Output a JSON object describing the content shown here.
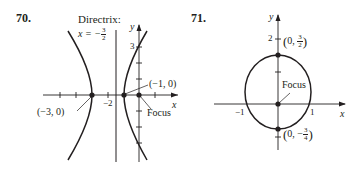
{
  "problems": [
    {
      "number": "70.",
      "type": "parabola",
      "directrix_label": "Directrix:",
      "directrix_eq": {
        "lhs": "x = −",
        "num": "3",
        "den": "2"
      },
      "axis_labels": {
        "x": "x",
        "y": "y"
      },
      "tick_labels": {
        "x_neg2": "−2",
        "y_3": "3"
      },
      "points": [
        {
          "label": "(−3, 0)",
          "x": -3,
          "y": 0
        },
        {
          "label": "(−1, 0)",
          "x": -1,
          "y": 0
        }
      ],
      "focus_label": "Focus",
      "focus": {
        "x": 0,
        "y": 0
      },
      "directrix_x": -1.5
    },
    {
      "number": "71.",
      "type": "ellipse",
      "axis_labels": {
        "x": "x",
        "y": "y"
      },
      "tick_labels": {
        "x_neg1": "−1",
        "x_1": "1",
        "y_2": "2"
      },
      "points": [
        {
          "label_prefix": "0, ",
          "num": "3",
          "den": "2",
          "sign": "",
          "x": 0,
          "y": 1.5
        },
        {
          "label_prefix": "0, −",
          "num": "3",
          "den": "4",
          "sign": "−",
          "x": 0,
          "y": -0.75
        }
      ],
      "focus_label": "Focus",
      "focus": {
        "x": 0,
        "y": 0
      }
    }
  ],
  "colors": {
    "ink": "#231f20",
    "axis": "#3a3a3a"
  }
}
